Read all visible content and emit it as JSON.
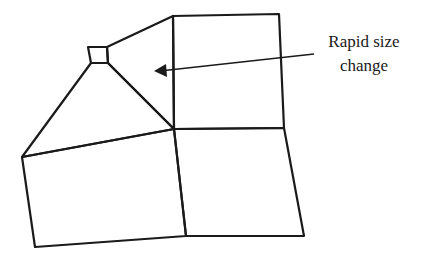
{
  "diagram": {
    "stroke_color": "#1a1a1a",
    "annotation": {
      "line1": "Rapid size",
      "line2": "change"
    },
    "elements": [
      {
        "name": "small-square-element",
        "points": "88,47 107,47 108,63 91,63"
      },
      {
        "name": "upper-triangle-element",
        "points": "107,47 173,16 174,129 108,63"
      },
      {
        "name": "left-triangle-element",
        "points": "91,63 108,63 174,129 22,157"
      },
      {
        "name": "top-right-quad-element",
        "points": "173,16 279,14 284,128 174,129"
      },
      {
        "name": "bottom-left-quad-element",
        "points": "22,157 174,129 186,236 35,247"
      },
      {
        "name": "bottom-right-quad-element",
        "points": "174,129 284,128 304,236 186,236"
      }
    ],
    "arrow": {
      "x1": 314,
      "y1": 54,
      "x2": 160,
      "y2": 71
    }
  }
}
